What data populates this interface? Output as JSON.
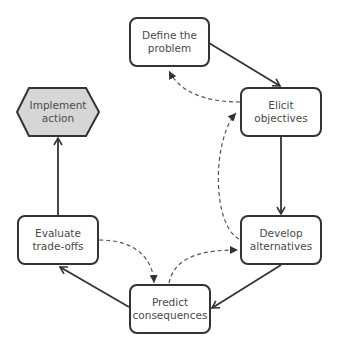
{
  "diagram": {
    "type": "process-cycle",
    "nodes": [
      {
        "id": "define",
        "label_line1": "Define the",
        "label_line2": "problem",
        "shape": "rounded-rect"
      },
      {
        "id": "elicit",
        "label_line1": "Elicit",
        "label_line2": "objectives",
        "shape": "rounded-rect"
      },
      {
        "id": "develop",
        "label_line1": "Develop",
        "label_line2": "alternatives",
        "shape": "rounded-rect"
      },
      {
        "id": "predict",
        "label_line1": "Predict",
        "label_line2": "consequences",
        "shape": "rounded-rect"
      },
      {
        "id": "evaluate",
        "label_line1": "Evaluate",
        "label_line2": "trade-offs",
        "shape": "rounded-rect"
      },
      {
        "id": "implement",
        "label_line1": "Implement",
        "label_line2": "action",
        "shape": "hexagon"
      }
    ],
    "edges": [
      {
        "from": "define",
        "to": "elicit",
        "style": "solid"
      },
      {
        "from": "elicit",
        "to": "develop",
        "style": "solid"
      },
      {
        "from": "develop",
        "to": "predict",
        "style": "solid"
      },
      {
        "from": "predict",
        "to": "evaluate",
        "style": "solid"
      },
      {
        "from": "evaluate",
        "to": "implement",
        "style": "solid"
      },
      {
        "from": "elicit",
        "to": "define",
        "style": "dashed"
      },
      {
        "from": "develop",
        "to": "elicit",
        "style": "dashed"
      },
      {
        "from": "predict",
        "to": "develop",
        "style": "dashed"
      },
      {
        "from": "evaluate",
        "to": "predict",
        "style": "dashed"
      }
    ],
    "colors": {
      "stroke": "#333333",
      "dashed": "#555555",
      "hex_fill": "#d6d6d6",
      "text": "#4a4a4a"
    }
  }
}
